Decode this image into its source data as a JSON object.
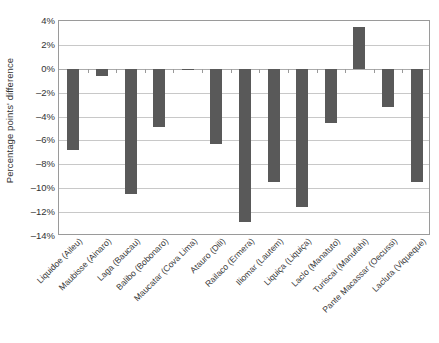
{
  "chart_data": {
    "type": "bar",
    "title": "",
    "subtitle": "",
    "xlabel": "",
    "ylabel": "Percentage points' difference",
    "ylim": [
      -14,
      4
    ],
    "ytick_step": 2,
    "ytick_labels": [
      "4%",
      "2%",
      "0%",
      "–2%",
      "–4%",
      "–6%",
      "–8%",
      "–10%",
      "–12%",
      "–14%"
    ],
    "ytick_values": [
      4,
      2,
      0,
      -2,
      -4,
      -6,
      -8,
      -10,
      -12,
      -14
    ],
    "grid": true,
    "legend": false,
    "legend_position": "none",
    "bar_color": "#595959",
    "categories": [
      "Liquidoe (Aileu)",
      "Maubisse (Ainaro)",
      "Laga (Baucau)",
      "Balibo (Bobonaro)",
      "Maucatar (Cova Lima)",
      "Atauro (Dili)",
      "Railaco (Ermera)",
      "Iliomar (Lautem)",
      "Liquiça (Liquiça)",
      "Laclo (Manatuto)",
      "Turiscai (Manufahi)",
      "Pante Macassar (Oecussi)",
      "Lacluta (Viqueque)"
    ],
    "values": [
      -6.8,
      -0.6,
      -10.5,
      -4.9,
      -0.1,
      -6.3,
      -12.8,
      -9.5,
      -11.6,
      -4.5,
      3.5,
      -3.2,
      -9.5
    ]
  }
}
